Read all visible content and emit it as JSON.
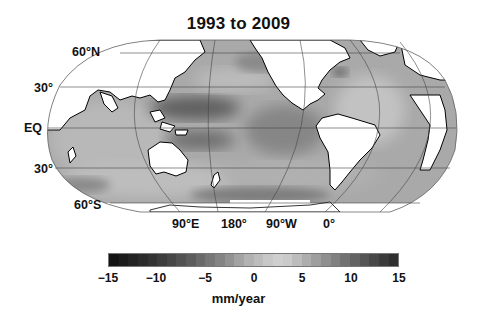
{
  "title": "1993 to 2009",
  "lat_labels": [
    {
      "label": "60°N",
      "x": 72,
      "y": 45
    },
    {
      "label": "30°",
      "x": 34,
      "y": 81
    },
    {
      "label": "EQ",
      "x": 24,
      "y": 121
    },
    {
      "label": "30°",
      "x": 34,
      "y": 162
    },
    {
      "label": "60°S",
      "x": 74,
      "y": 198
    }
  ],
  "lon_labels": [
    {
      "label": "90°E",
      "x": 172
    },
    {
      "label": "180°",
      "x": 221
    },
    {
      "label": "90°W",
      "x": 266
    },
    {
      "label": "0°",
      "x": 323
    }
  ],
  "colorbar": {
    "unit": "mm/year",
    "min": -15,
    "max": 15,
    "ticks": [
      "−15",
      "−10",
      "−5",
      "0",
      "5",
      "10",
      "15"
    ],
    "colors": [
      "#141414",
      "#1c1c1c",
      "#242424",
      "#2c2c2c",
      "#343434",
      "#3d3d3d",
      "#474747",
      "#525252",
      "#5d5d5d",
      "#6a6a6a",
      "#777777",
      "#848484",
      "#939393",
      "#a3a3a3",
      "#b2b2b2",
      "#bdbdbd",
      "#c8c8c8",
      "#cfcfcf",
      "#cacaca",
      "#bcbcbc",
      "#adadad",
      "#9e9e9e",
      "#8f8f8f",
      "#808080",
      "#717171",
      "#636363",
      "#555555",
      "#484848",
      "#3b3b3b",
      "#2f2f2f"
    ]
  },
  "chart_data": {
    "type": "heatmap",
    "title": "1993 to 2009",
    "xlabel": "",
    "ylabel": "",
    "x_tick_labels": [
      "90°E",
      "180°",
      "90°W",
      "0°"
    ],
    "y_tick_labels": [
      "60°N",
      "30°",
      "EQ",
      "30°",
      "60°S"
    ],
    "colorbar": {
      "label": "mm/year",
      "range": [
        -15,
        15
      ],
      "ticks": [
        -15,
        -10,
        -5,
        0,
        5,
        10,
        15
      ],
      "colormap": "grayscale diverging (dark at both extremes, light near +3)"
    },
    "regions_highlight": [
      {
        "region": "Western tropical Pacific",
        "trend": "high positive (~8-12 mm/yr, dark)"
      },
      {
        "region": "Eastern tropical Pacific",
        "trend": "near zero to slightly negative (medium-dark)"
      },
      {
        "region": "North Pacific (Kuroshio band)",
        "trend": "high (dark band)"
      },
      {
        "region": "Indian Ocean",
        "trend": "~0 to 5 mm/yr (light gray)"
      },
      {
        "region": "North Atlantic (Gulf Stream region)",
        "trend": "localized dark patch"
      },
      {
        "region": "Southern Ocean",
        "trend": "mixed, medium gray"
      }
    ]
  }
}
